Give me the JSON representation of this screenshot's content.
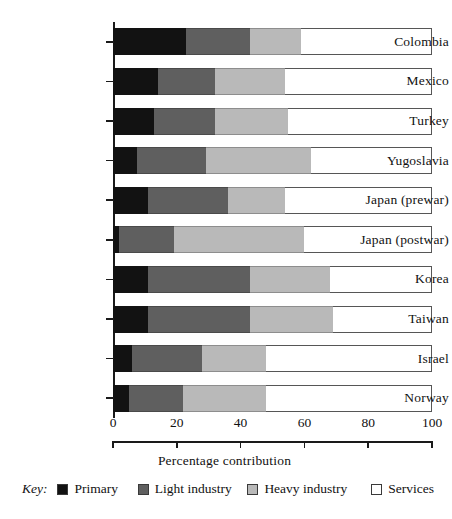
{
  "chart_data": {
    "type": "bar",
    "orientation": "horizontal",
    "stacked": true,
    "title": "",
    "xlabel": "Percentage contribution",
    "ylabel": "",
    "xlim": [
      0,
      100
    ],
    "xticks": [
      0,
      20,
      40,
      60,
      80,
      100
    ],
    "xtick_labels": [
      "0",
      "20",
      "40",
      "60",
      "80",
      "100"
    ],
    "grid": false,
    "legend_position": "bottom",
    "legend_title": "Key:",
    "categories": [
      "Colombia",
      "Mexico",
      "Turkey",
      "Yugoslavia",
      "Japan (prewar)",
      "Japan (postwar)",
      "Korea",
      "Taiwan",
      "Israel",
      "Norway"
    ],
    "series": [
      {
        "name": "Primary",
        "color": "#121212",
        "values": [
          23,
          14,
          13,
          7.5,
          11,
          2,
          11,
          11,
          6,
          5
        ]
      },
      {
        "name": "Light industry",
        "color": "#5f5f5f",
        "values": [
          20,
          18,
          19,
          21.5,
          25,
          17,
          32,
          32,
          22,
          17
        ]
      },
      {
        "name": "Heavy industry",
        "color": "#b9b9b9",
        "values": [
          16,
          22,
          23,
          33,
          18,
          41,
          25,
          26,
          20,
          26
        ]
      },
      {
        "name": "Services",
        "color": "#ffffff",
        "values": [
          41,
          46,
          45,
          38,
          46,
          40,
          32,
          31,
          52,
          52
        ]
      }
    ]
  },
  "legend": {
    "key_word": "Key:",
    "items": [
      {
        "label": "Primary",
        "color": "#121212"
      },
      {
        "label": "Light industry",
        "color": "#5f5f5f"
      },
      {
        "label": "Heavy industry",
        "color": "#b9b9b9"
      },
      {
        "label": "Services",
        "color": "#ffffff"
      }
    ]
  }
}
